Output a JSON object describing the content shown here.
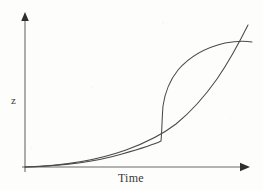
{
  "figure": {
    "background_color": "#fdfdfc",
    "line_color": "#4a4a4a",
    "axis_color": "#5a5a5a",
    "width": 263,
    "height": 190
  },
  "axes": {
    "x_label": "Time",
    "y_label": "z",
    "x_axis_name": "time-axis",
    "y_axis_name": "z-axis",
    "x_arrow_icon": "arrow-right-icon",
    "y_arrow_icon": "arrow-up-icon",
    "origin": {
      "x": 25,
      "y": 167
    },
    "x_axis_end": {
      "x": 248,
      "y": 167
    },
    "y_axis_top": {
      "x": 25,
      "y": 14
    },
    "ticks": [],
    "gridlines": false
  },
  "chart_data": {
    "type": "line",
    "title": "",
    "subtitle": "",
    "xlabel": "Time",
    "ylabel": "z",
    "xlim": [
      0,
      1
    ],
    "ylim": [
      0,
      1
    ],
    "grid": false,
    "legend": "none",
    "annotations": [],
    "tick_labels": {
      "x": [],
      "y": []
    },
    "series": [
      {
        "name": "sigmoid-curve",
        "description": "S-shaped curve: flat near zero, abrupt near-vertical jump at mid-time, then saturating plateau",
        "x": [
          0.0,
          0.1,
          0.2,
          0.3,
          0.4,
          0.5,
          0.58,
          0.6,
          0.605,
          0.61,
          0.63,
          0.66,
          0.7,
          0.75,
          0.8,
          0.86,
          0.92,
          0.97,
          1.02
        ],
        "y": [
          0.0,
          0.01,
          0.02,
          0.04,
          0.07,
          0.12,
          0.17,
          0.18,
          0.3,
          0.45,
          0.58,
          0.67,
          0.74,
          0.8,
          0.84,
          0.87,
          0.885,
          0.89,
          0.885
        ],
        "path": "M 25,167 C 60,166 95,162 122,154 C 143,148 155,144 161,141 C 162,130 162,118 163,106 C 165,92 170,80 178,70 C 190,56 208,47 225,43 C 236,41 246,41 252,42"
      },
      {
        "name": "exponential-curve",
        "description": "Smooth convex growth curve: slowly rising from origin then accelerating steeply at the end",
        "x": [
          0.0,
          0.1,
          0.2,
          0.3,
          0.4,
          0.5,
          0.6,
          0.68,
          0.75,
          0.82,
          0.88,
          0.93,
          0.97,
          1.0
        ],
        "y": [
          0.0,
          0.01,
          0.02,
          0.04,
          0.07,
          0.11,
          0.18,
          0.26,
          0.36,
          0.49,
          0.62,
          0.76,
          0.88,
          0.96
        ],
        "path": "M 25,167 C 62,166 98,160 126,150 C 148,142 163,134 176,124 C 192,111 205,96 217,79 C 228,63 238,45 248,25"
      }
    ],
    "intersections": [
      {
        "name": "lower-branch-point",
        "x": 161,
        "y": 141
      },
      {
        "name": "upper-crossing-point",
        "x": 244,
        "y": 43
      }
    ]
  }
}
